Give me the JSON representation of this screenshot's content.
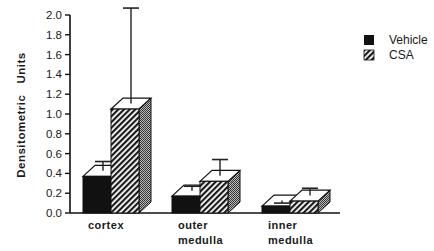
{
  "chart_data": {
    "type": "bar",
    "title": "",
    "xlabel": "",
    "ylabel": "Densitometric   Units",
    "ylim": [
      0,
      2.0
    ],
    "yticks": [
      "0.0",
      "0.2",
      "0.4",
      "0.6",
      "0.8",
      "1.0",
      "1.2",
      "1.4",
      "1.6",
      "1.8",
      "2.0"
    ],
    "categories": [
      {
        "line1": "cortex",
        "line2": ""
      },
      {
        "line1": "outer",
        "line2": "medulla"
      },
      {
        "line1": "inner",
        "line2": "medulla"
      }
    ],
    "series": [
      {
        "name": "Vehicle",
        "fill": "solid",
        "color": "#111111",
        "values": [
          0.37,
          0.17,
          0.07
        ],
        "error_upper": [
          0.52,
          0.27,
          0.1
        ]
      },
      {
        "name": "CSA",
        "fill": "hatched",
        "color": "#333333",
        "values": [
          1.05,
          0.32,
          0.12
        ],
        "error_upper": [
          2.07,
          0.54,
          0.25
        ]
      }
    ],
    "grid": false,
    "legend_position": "top-right",
    "style": "3d-bars-with-error-bars"
  },
  "legend": {
    "items": [
      {
        "label": "Vehicle"
      },
      {
        "label": "CSA"
      }
    ]
  }
}
